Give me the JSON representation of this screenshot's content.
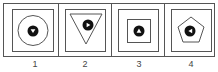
{
  "figure": {
    "options": [
      {
        "label": "1",
        "outer_shape": "circle",
        "dot_glyph": "triangle-down"
      },
      {
        "label": "2",
        "outer_shape": "triangle-down",
        "dot_glyph": "triangle-right"
      },
      {
        "label": "3",
        "outer_shape": "square",
        "dot_glyph": "triangle-up"
      },
      {
        "label": "4",
        "outer_shape": "pentagon",
        "dot_glyph": "triangle-left"
      }
    ],
    "colors": {
      "line": "#555555",
      "fill": "#111111",
      "background": "#ffffff"
    }
  }
}
